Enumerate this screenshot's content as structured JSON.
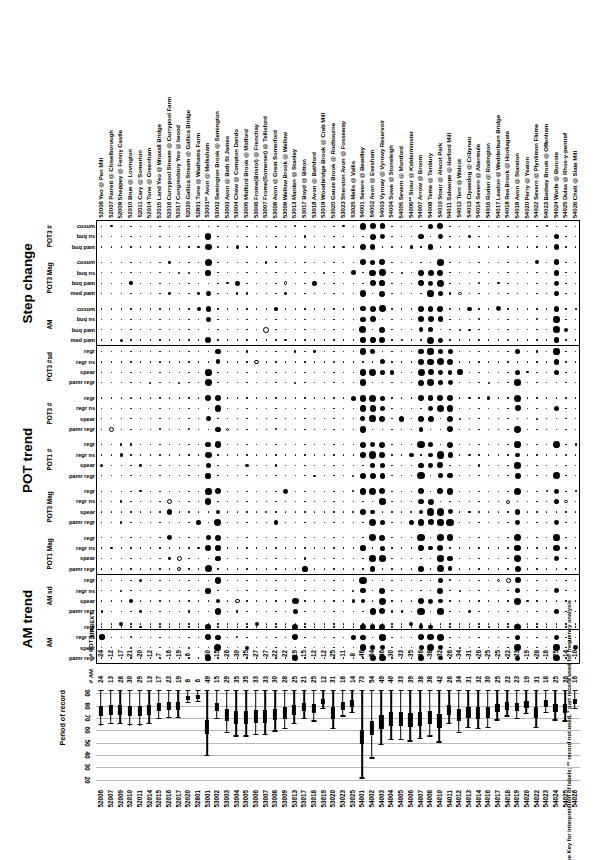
{
  "figure": {
    "footnote": "See Key for interpretation of labels; ** record not used, * part record used for frequency analysis",
    "ylabel": "Period of record",
    "count_labels": {
      "pot": "# POT yrs",
      "am": "# AM"
    },
    "urbext_label": "URBEXT"
  },
  "sections": [
    {
      "title": "Step change",
      "groups": [
        {
          "label": "POT3 #",
          "rows": [
            "cusum",
            "buq ns",
            "buq pam"
          ]
        },
        {
          "label": "POT3 Mag",
          "rows": [
            "cusum",
            "buq ns",
            "buq pam",
            "med pam"
          ]
        },
        {
          "label": "AM",
          "rows": [
            "cusum",
            "buq ns",
            "buq pam",
            "med pam"
          ]
        }
      ]
    },
    {
      "title": "POT trend",
      "groups": [
        {
          "label": "POT3 #sd",
          "rows": [
            "regr",
            "regr ns",
            "spear",
            "pamr regr"
          ]
        },
        {
          "label": "POT3 #",
          "rows": [
            "regr",
            "regr ns",
            "spear",
            "pamr regr"
          ]
        },
        {
          "label": "POT1 #",
          "rows": [
            "regr",
            "regr ns",
            "spear",
            "pamr regr"
          ]
        },
        {
          "label": "POT3 Mag",
          "rows": [
            "regr",
            "regr ns",
            "spear",
            "pamr regr"
          ]
        },
        {
          "label": "POT1 Mag",
          "rows": [
            "regr",
            "regr ns",
            "spear",
            "pamr regr"
          ]
        }
      ]
    },
    {
      "title": "AM trend",
      "groups": [
        {
          "label": "AM sd",
          "rows": [
            "regr",
            "regr ns",
            "spear",
            "pamr regr"
          ]
        },
        {
          "label": "AM",
          "rows": [
            "regr",
            "regr ns",
            "spear",
            "pamr regr"
          ]
        }
      ]
    }
  ],
  "stations": [
    {
      "id": "52006",
      "name": "Yeo @ Pen Mill",
      "pot": 24,
      "am": 24,
      "start": 1964,
      "end": 1993,
      "urbext": 0
    },
    {
      "id": "52007",
      "name": "Parrett @ Chiselborough",
      "pot": 12,
      "am": 13,
      "start": 1965,
      "end": 1993,
      "urbext": 0
    },
    {
      "id": "52009",
      "name": "Sheppey @ Fenny Castle",
      "pot": 17,
      "am": 28,
      "start": 1965,
      "end": 1993,
      "urbext": 1
    },
    {
      "id": "52010",
      "name": "Brue @ Lovington",
      "pot": 21,
      "am": 30,
      "start": 1964,
      "end": 1993,
      "urbext": 0
    },
    {
      "id": "52011",
      "name": "Cary @ Somerton",
      "pot": 20,
      "am": 29,
      "start": 1964,
      "end": 1993,
      "urbext": 0
    },
    {
      "id": "52014",
      "name": "Tone @ Greenham",
      "pot": 12,
      "am": 13,
      "start": 1965,
      "end": 1993,
      "urbext": 0
    },
    {
      "id": "52015",
      "name": "Land Yeo @ Wraxall Bridge",
      "pot": 7,
      "am": 17,
      "start": 1969,
      "end": 1993,
      "urbext": 0
    },
    {
      "id": "52016",
      "name": "Currypool Stream @ Currypool Farm",
      "pot": 16,
      "am": 23,
      "start": 1970,
      "end": 1993,
      "urbext": 0
    },
    {
      "id": "52017",
      "name": "Congresbury Yeo @ Iwood",
      "pot": 19,
      "am": 19,
      "start": 1970,
      "end": 1993,
      "urbext": 0
    },
    {
      "id": "52020",
      "name": "Gallica Stream @ Gallica Bridge",
      "pot": 6,
      "am": 8,
      "start": 1982,
      "end": 1993,
      "urbext": 0
    },
    {
      "id": "52801",
      "name": "Tone @ Wadhams Farm",
      "pot": null,
      "am": 6,
      "start": 1983,
      "end": 1993,
      "urbext": 0
    },
    {
      "id": "53001**",
      "name": "Avon @ Melksham",
      "pot": 50,
      "am": 49,
      "start": 1939,
      "end": 1993,
      "urbext": 0
    },
    {
      "id": "53002",
      "name": "Semington Brook @ Semington",
      "pot": 15,
      "am": 15,
      "start": 1969,
      "end": 1993,
      "urbext": 0
    },
    {
      "id": "53003",
      "name": "Avon @ Bath St James",
      "pot": 26,
      "am": 29,
      "start": 1958,
      "end": 1993,
      "urbext": 0
    },
    {
      "id": "53004",
      "name": "Chew @ Compton Dando",
      "pot": 30,
      "am": 35,
      "start": 1955,
      "end": 1993,
      "urbext": 0
    },
    {
      "id": "53005",
      "name": "Midford Brook @ Midford",
      "pot": 35,
      "am": 35,
      "start": 1955,
      "end": 1993,
      "urbext": 0
    },
    {
      "id": "53006",
      "name": "Frome(Bristol) @ Frenchay",
      "pot": 27,
      "am": 33,
      "start": 1956,
      "end": 1993,
      "urbext": 1
    },
    {
      "id": "53007",
      "name": "Frome(Somerset) @ Tellisford",
      "pot": 27,
      "am": 33,
      "start": 1956,
      "end": 1993,
      "urbext": 0
    },
    {
      "id": "53008",
      "name": "Avon @ Great Somerford",
      "pot": 22,
      "am": 30,
      "start": 1959,
      "end": 1993,
      "urbext": 0
    },
    {
      "id": "53009",
      "name": "Wellow Brook @ Wellow",
      "pot": 22,
      "am": 28,
      "start": 1961,
      "end": 1993,
      "urbext": 0
    },
    {
      "id": "53013",
      "name": "Marden @ Stanley",
      "pot": 19,
      "am": 25,
      "start": 1965,
      "end": 1993,
      "urbext": 0
    },
    {
      "id": "53017",
      "name": "Boyd @ Bitton",
      "pot": 15,
      "am": 21,
      "start": 1969,
      "end": 1993,
      "urbext": 0
    },
    {
      "id": "53018",
      "name": "Avon @ Bathford",
      "pot": 12,
      "am": 25,
      "start": 1967,
      "end": 1993,
      "urbext": 0
    },
    {
      "id": "53019",
      "name": "Woodbridge Brook @ Crab Mill",
      "pot": 12,
      "am": 12,
      "start": 1977,
      "end": 1993,
      "urbext": 0
    },
    {
      "id": "53020",
      "name": "Gauze Brook @ Rodbourne",
      "pot": 25,
      "am": 31,
      "start": 1961,
      "end": 1993,
      "urbext": 0
    },
    {
      "id": "53023",
      "name": "Sherston Avon @ Fosseway",
      "pot": 11,
      "am": 18,
      "start": 1971,
      "end": 1993,
      "urbext": 0
    },
    {
      "id": "53025",
      "name": "Mells @ Vallis",
      "pot": 8,
      "am": 14,
      "start": 1974,
      "end": 1993,
      "urbext": 0
    },
    {
      "id": "54001",
      "name": "Severn @ Bewdley",
      "pot": 46,
      "am": 73,
      "start": 1921,
      "end": 1993,
      "urbext": 0
    },
    {
      "id": "54002",
      "name": "Avon @ Evesham",
      "pot": 54,
      "am": 54,
      "start": 1937,
      "end": 1993,
      "urbext": 0
    },
    {
      "id": "54003",
      "name": "Vyrnwy @ Vyrnwy Reservoir",
      "pot": 46,
      "am": 49,
      "start": 1948,
      "end": 1993,
      "urbext": 0
    },
    {
      "id": "54004",
      "name": "Sowe @ Stoneleigh",
      "pot": 30,
      "am": 40,
      "start": 1952,
      "end": 1993,
      "urbext": 0
    },
    {
      "id": "54005",
      "name": "Severn @ Montford",
      "pot": 33,
      "am": 33,
      "start": 1952,
      "end": 1993,
      "urbext": 0
    },
    {
      "id": "54006**",
      "name": "Stour @ Kidderminster",
      "pot": 35,
      "am": 39,
      "start": 1951,
      "end": 1993,
      "urbext": 1
    },
    {
      "id": "54007",
      "name": "Arrow @ Broom",
      "pot": 36,
      "am": 38,
      "start": 1953,
      "end": 1993,
      "urbext": 0
    },
    {
      "id": "54008",
      "name": "Teme @ Tenbury",
      "pot": 38,
      "am": 38,
      "start": 1955,
      "end": 1993,
      "urbext": 0
    },
    {
      "id": "54010",
      "name": "Stour @ Alscot Park",
      "pot": 32,
      "am": 42,
      "start": 1950,
      "end": 1993,
      "urbext": 0
    },
    {
      "id": "54011",
      "name": "Salwarpe @ Harford Mill",
      "pot": 26,
      "am": 26,
      "start": 1965,
      "end": 1993,
      "urbext": 0
    },
    {
      "id": "54012",
      "name": "Tern @ Walcot",
      "pot": 34,
      "am": 34,
      "start": 1958,
      "end": 1993,
      "urbext": 0
    },
    {
      "id": "54013",
      "name": "Clywedog @ Cribynau",
      "pot": 31,
      "am": 31,
      "start": 1962,
      "end": 1993,
      "urbext": 0
    },
    {
      "id": "54014",
      "name": "Severn @ Abermule",
      "pot": 26,
      "am": 32,
      "start": 1961,
      "end": 1993,
      "urbext": 0
    },
    {
      "id": "54016",
      "name": "Roden @ Rodington",
      "pot": 25,
      "am": 30,
      "start": 1962,
      "end": 1993,
      "urbext": 0
    },
    {
      "id": "54017",
      "name": "Leadon @ Wedderburn Bridge",
      "pot": 25,
      "am": 25,
      "start": 1968,
      "end": 1993,
      "urbext": 0
    },
    {
      "id": "54018",
      "name": "Rea Brook @ Hookagate",
      "pot": 22,
      "am": 22,
      "start": 1971,
      "end": 1993,
      "urbext": 0
    },
    {
      "id": "54019",
      "name": "Avon @ Stareton",
      "pot": 23,
      "am": 23,
      "start": 1969,
      "end": 1993,
      "urbext": 0
    },
    {
      "id": "54020",
      "name": "Perry @ Yeaton",
      "pot": 19,
      "am": 19,
      "start": 1973,
      "end": 1993,
      "urbext": 0
    },
    {
      "id": "54022",
      "name": "Severn @ Plynlimon Flume",
      "pot": 28,
      "am": 31,
      "start": 1962,
      "end": 1993,
      "urbext": 0
    },
    {
      "id": "54023",
      "name": "Badsey Brook @ Offenham",
      "pot": 18,
      "am": 18,
      "start": 1974,
      "end": 1993,
      "urbext": 0
    },
    {
      "id": "54024",
      "name": "Worfe @ Burcote",
      "pot": 25,
      "am": 25,
      "start": 1968,
      "end": 1993,
      "urbext": 0
    },
    {
      "id": "54025",
      "name": "Dulas @ Rhos-y-pentref",
      "pot": 14,
      "am": 26,
      "start": 1967,
      "end": 1993,
      "urbext": 0
    },
    {
      "id": "54026",
      "name": "Chelt @ Slate Mill",
      "pot": 10,
      "am": 16,
      "start": 1977,
      "end": 1993,
      "urbext": 0
    }
  ],
  "chart_data": {
    "type": "table",
    "legend": "Filled circles indicate positive/significant results, open circles negative; circle area scales with magnitude",
    "timeline": {
      "type": "range-bar",
      "ylabel": "Period of record",
      "yticks": [
        20,
        30,
        40,
        50,
        60,
        70,
        80,
        90
      ],
      "ylim": [
        1915,
        1996
      ]
    },
    "matrix_values": {
      "note": "Each row/station cell encodes a test statistic magnitude by marker size: 0 = minimal dot, 1..4 = increasing filled circle, -1..-4 = open circle",
      "step_change": {
        "POT3 #": {
          "cusum": [
            0,
            0,
            0,
            0,
            0,
            0,
            0,
            0,
            0,
            0,
            0,
            3,
            0,
            0,
            0,
            0,
            0,
            0,
            0,
            0,
            0,
            0,
            0,
            0,
            0,
            0,
            0,
            0,
            0,
            0,
            0,
            0,
            0,
            0,
            0,
            0,
            0,
            0,
            0,
            0,
            0,
            0,
            0,
            0,
            0,
            0,
            0,
            0,
            0,
            0
          ],
          "buq ns": [
            0,
            0,
            0,
            0,
            0,
            0,
            0,
            0,
            0,
            0,
            0,
            3,
            0,
            0,
            0,
            0,
            0,
            0,
            0,
            0,
            0,
            0,
            0,
            0,
            0,
            0,
            0,
            2,
            0,
            0,
            0,
            0,
            0,
            0,
            0,
            0,
            0,
            0,
            0,
            0,
            0,
            0,
            0,
            0,
            0,
            0,
            0,
            0,
            0,
            0
          ],
          "buq pam": [
            0,
            0,
            0,
            0,
            0,
            0,
            0,
            0,
            0,
            0,
            0,
            3,
            0,
            0,
            0,
            0,
            0,
            0,
            0,
            0,
            0,
            0,
            0,
            0,
            0,
            0,
            0,
            3,
            4,
            0,
            0,
            0,
            0,
            0,
            0,
            0,
            0,
            0,
            0,
            0,
            0,
            0,
            0,
            0,
            0,
            0,
            0,
            0,
            0,
            0
          ]
        },
        "POT3 Mag": {
          "cusum": [
            0,
            0,
            0,
            0,
            0,
            0,
            0,
            0,
            0,
            0,
            0,
            0,
            0,
            0,
            0,
            0,
            0,
            0,
            0,
            0,
            0,
            0,
            0,
            0,
            0,
            0,
            0,
            0,
            0,
            0,
            0,
            0,
            0,
            0,
            0,
            0,
            0,
            0,
            0,
            0,
            0,
            0,
            0,
            0,
            0,
            0,
            0,
            0,
            0,
            0
          ],
          "buq ns": [
            0,
            0,
            0,
            0,
            0,
            0,
            0,
            0,
            0,
            0,
            0,
            3,
            0,
            0,
            0,
            0,
            0,
            0,
            0,
            0,
            0,
            0,
            0,
            0,
            0,
            0,
            0,
            0,
            0,
            0,
            0,
            0,
            0,
            0,
            0,
            0,
            0,
            0,
            0,
            0,
            0,
            0,
            0,
            0,
            0,
            0,
            0,
            0,
            0,
            0
          ],
          "buq pam": [
            0,
            0,
            0,
            0,
            0,
            0,
            0,
            0,
            0,
            0,
            0,
            3,
            0,
            0,
            0,
            0,
            0,
            0,
            0,
            0,
            0,
            0,
            0,
            0,
            0,
            0,
            0,
            0,
            0,
            0,
            0,
            0,
            0,
            0,
            0,
            0,
            0,
            0,
            0,
            0,
            0,
            0,
            0,
            0,
            0,
            0,
            0,
            0,
            0,
            0
          ],
          "med pam": [
            0,
            0,
            0,
            0,
            0,
            0,
            0,
            0,
            0,
            0,
            0,
            4,
            0,
            0,
            0,
            0,
            0,
            0,
            0,
            0,
            0,
            0,
            0,
            0,
            0,
            0,
            0,
            0,
            0,
            0,
            0,
            0,
            0,
            0,
            0,
            0,
            0,
            0,
            0,
            0,
            0,
            0,
            0,
            0,
            0,
            0,
            0,
            0,
            0,
            0
          ]
        },
        "AM": {
          "cusum": [
            0,
            0,
            0,
            0,
            0,
            0,
            0,
            0,
            0,
            0,
            0,
            0,
            0,
            0,
            0,
            0,
            0,
            0,
            0,
            0,
            0,
            0,
            0,
            0,
            0,
            0,
            0,
            0,
            0,
            0,
            0,
            0,
            0,
            0,
            0,
            0,
            0,
            0,
            0,
            0,
            0,
            0,
            0,
            0,
            0,
            0,
            0,
            0,
            0,
            0
          ],
          "buq ns": [
            0,
            0,
            0,
            0,
            0,
            0,
            0,
            0,
            0,
            0,
            0,
            0,
            0,
            0,
            0,
            0,
            0,
            0,
            0,
            0,
            0,
            0,
            0,
            0,
            0,
            0,
            0,
            0,
            0,
            0,
            0,
            0,
            0,
            0,
            0,
            0,
            0,
            0,
            0,
            0,
            0,
            0,
            0,
            0,
            0,
            0,
            0,
            0,
            0,
            0
          ],
          "buq pam": [
            0,
            0,
            0,
            0,
            0,
            0,
            0,
            0,
            0,
            0,
            0,
            0,
            0,
            0,
            0,
            0,
            0,
            0,
            0,
            0,
            2,
            0,
            0,
            0,
            0,
            0,
            0,
            3,
            0,
            0,
            0,
            0,
            0,
            0,
            0,
            0,
            0,
            0,
            0,
            0,
            0,
            0,
            0,
            0,
            0,
            0,
            0,
            0,
            0,
            0
          ],
          "med pam": [
            0,
            0,
            0,
            0,
            0,
            0,
            0,
            0,
            0,
            0,
            0,
            0,
            0,
            0,
            0,
            0,
            0,
            0,
            0,
            0,
            0,
            0,
            0,
            0,
            0,
            0,
            0,
            4,
            0,
            0,
            0,
            0,
            0,
            0,
            0,
            0,
            0,
            0,
            0,
            0,
            0,
            0,
            0,
            0,
            0,
            0,
            0,
            0,
            0,
            0
          ]
        }
      }
    }
  }
}
